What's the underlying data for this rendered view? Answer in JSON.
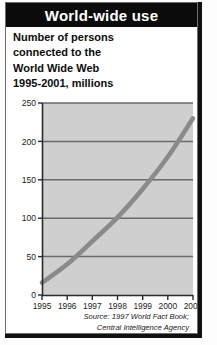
{
  "header": {
    "title": "World-wide use"
  },
  "subtitle": {
    "lines": [
      "Number of persons",
      "connected to the",
      "World Wide Web",
      "1995-2001, millions"
    ]
  },
  "source": {
    "lines": [
      "Source: 1997 World Fact Book;",
      "Central Intelligence Agency"
    ]
  },
  "colors": {
    "header_bg": "#0b0b0b",
    "header_text": "#ffffff",
    "card_bg": "#ffffff",
    "card_border": "#111111",
    "plot_bg": "#cfcfcf",
    "gridline": "#6a6a6a",
    "axis": "#2a2a2a",
    "series_line": "#8a8a8a"
  },
  "chart_data": {
    "type": "line",
    "title": "World-wide use",
    "subtitle": "Number of persons connected to the World Wide Web 1995-2001, millions",
    "xlabel": "",
    "ylabel": "",
    "x": [
      1995,
      1996,
      1997,
      1998,
      1999,
      2000,
      2001
    ],
    "categories": [
      "1995",
      "1996",
      "1997",
      "1998",
      "1999",
      "2000",
      "2001"
    ],
    "values": [
      16,
      40,
      70,
      101,
      138,
      180,
      230
    ],
    "series": [
      {
        "name": "Persons connected to the World Wide Web (millions)",
        "values": [
          16,
          40,
          70,
          101,
          138,
          180,
          230
        ]
      }
    ],
    "ylim": [
      0,
      250
    ],
    "yticks": [
      0,
      50,
      100,
      150,
      200,
      250
    ],
    "ytick_labels": [
      "0",
      "50",
      "100",
      "150",
      "200",
      "250"
    ],
    "xticks": [
      1995,
      1996,
      1997,
      1998,
      1999,
      2000,
      2001
    ],
    "xtick_labels": [
      "1995",
      "1996",
      "1997",
      "1998",
      "1999",
      "2000",
      "2001"
    ],
    "grid": true,
    "grid_axis": "y",
    "legend": false,
    "legend_position": "none",
    "annotations": [],
    "source": "Source: 1997 World Fact Book; Central Intelligence Agency"
  }
}
